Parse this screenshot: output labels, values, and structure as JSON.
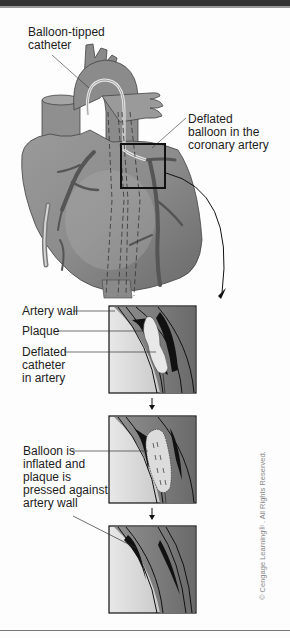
{
  "figure": {
    "labels": {
      "catheter": "Balloon-tipped\ncatheter",
      "catheter_line1": "Balloon-tipped",
      "catheter_line2": "catheter",
      "deflated_balloon_line1": "Deflated",
      "deflated_balloon_line2": "balloon in the",
      "deflated_balloon_line3": "coronary artery",
      "artery_wall": "Artery wall",
      "plaque": "Plaque",
      "deflated_catheter_line1": "Deflated",
      "deflated_catheter_line2": "catheter",
      "deflated_catheter_line3": "in artery",
      "inflated_line1": "Balloon is",
      "inflated_line2": "inflated and",
      "inflated_line3": "plaque is",
      "inflated_line4": "pressed against",
      "inflated_line5": "artery wall"
    },
    "copyright": "© Cengage Learning® . All Rights Reserved.",
    "panels": [
      {
        "name": "deflated-catheter-panel",
        "step": 1
      },
      {
        "name": "inflated-balloon-panel",
        "step": 2
      },
      {
        "name": "result-panel",
        "step": 3
      }
    ],
    "colors": {
      "heart_fill": "#8a8a8a",
      "heart_dark": "#5c5c5c",
      "artery_dark": "#1a1a1a",
      "plaque": "#e6e6e6",
      "background": "#fdfdfd"
    }
  }
}
